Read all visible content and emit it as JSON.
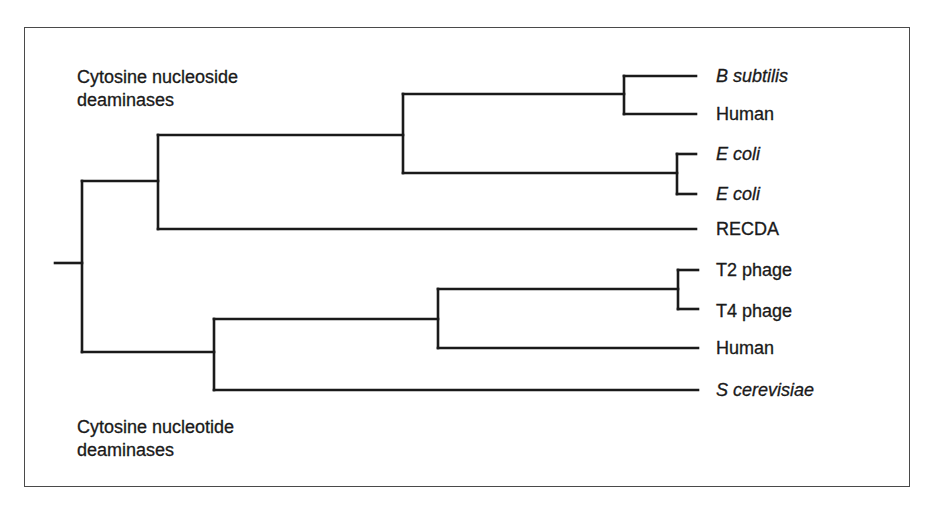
{
  "diagram": {
    "type": "phylogenetic-tree",
    "groups": {
      "top": {
        "line1": "Cytosine nucleoside",
        "line2": "deaminases"
      },
      "bottom": {
        "line1": "Cytosine nucleotide",
        "line2": "deaminases"
      }
    },
    "leaves": [
      {
        "label": "B subtilis",
        "italic": true
      },
      {
        "label": "Human",
        "italic": false
      },
      {
        "label": "E coli",
        "italic": true
      },
      {
        "label": "E coli",
        "italic": true
      },
      {
        "label": "RECDA",
        "italic": false
      },
      {
        "label": "T2 phage",
        "italic": false
      },
      {
        "label": "T4 phage",
        "italic": false
      },
      {
        "label": "Human",
        "italic": false
      },
      {
        "label": "S cerevisiae",
        "italic": true
      }
    ],
    "tree": {
      "root": {
        "children": [
          {
            "group": "Cytosine nucleoside deaminases",
            "children": [
              {
                "children": [
                  {
                    "children": [
                      "B subtilis",
                      "Human"
                    ]
                  },
                  {
                    "children": [
                      "E coli",
                      "E coli"
                    ]
                  }
                ]
              },
              "RECDA"
            ]
          },
          {
            "group": "Cytosine nucleotide deaminases",
            "children": [
              {
                "children": [
                  {
                    "children": [
                      "T2 phage",
                      "T4 phage"
                    ]
                  },
                  "Human"
                ]
              },
              "S cerevisiae"
            ]
          }
        ]
      }
    },
    "colors": {
      "line": "#1a1a1a",
      "frame": "#4a4a4a",
      "background": "#ffffff"
    }
  }
}
